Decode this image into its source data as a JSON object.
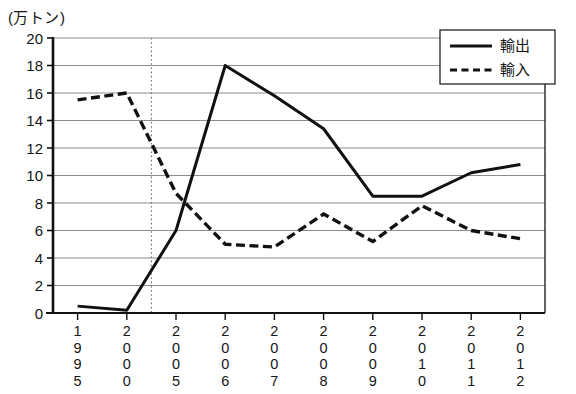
{
  "axis_unit_label": "(万トン)",
  "legend": {
    "export_label": "輸出",
    "import_label": "輸入"
  },
  "colors": {
    "line": "#111111",
    "grid": "#8c8c8c",
    "axis": "#111111",
    "background": "#ffffff",
    "divider": "#7a7a7a"
  },
  "chart_data": {
    "type": "line",
    "title": "",
    "xlabel": "",
    "ylabel": "(万トン)",
    "ylim": [
      0,
      20
    ],
    "ytick_step": 2,
    "yticks": [
      0,
      2,
      4,
      6,
      8,
      10,
      12,
      14,
      16,
      18,
      20
    ],
    "grid": true,
    "legend_position": "top-right",
    "categories": [
      "1995",
      "2000",
      "2005",
      "2006",
      "2007",
      "2008",
      "2009",
      "2010",
      "2011",
      "2012"
    ],
    "annotations": [
      {
        "type": "vertical-dotted-line",
        "between": [
          "2000",
          "2005"
        ],
        "position_fraction": 0.5
      }
    ],
    "series": [
      {
        "name": "輸出",
        "style": "solid",
        "values": [
          0.5,
          0.2,
          6.0,
          18.0,
          15.8,
          13.4,
          8.5,
          8.5,
          10.2,
          10.8
        ]
      },
      {
        "name": "輸入",
        "style": "dashed",
        "values": [
          15.5,
          16.0,
          8.7,
          5.0,
          4.8,
          7.2,
          5.2,
          7.8,
          6.0,
          5.4
        ]
      }
    ]
  }
}
